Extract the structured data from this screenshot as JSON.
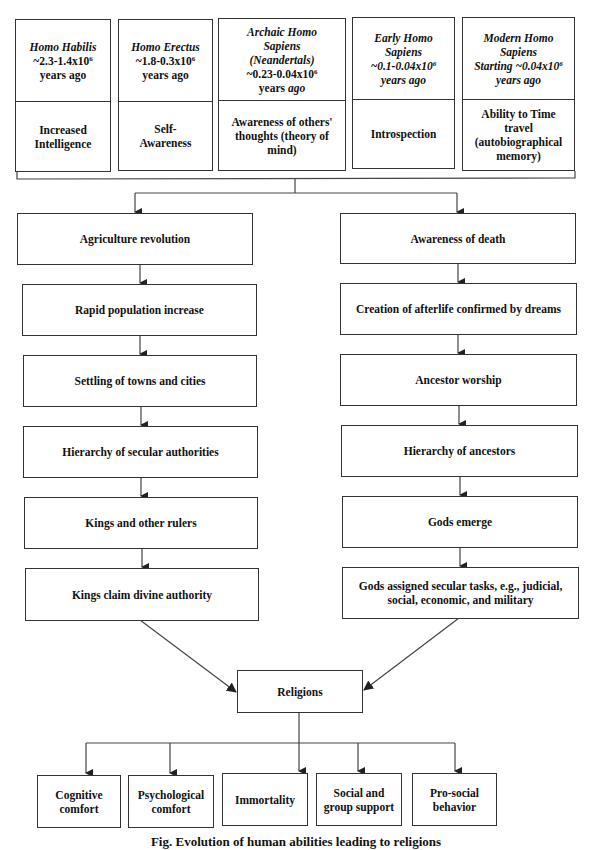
{
  "species": [
    {
      "name": "Homo Habilis",
      "range": "~2.3-1.4x10",
      "exp": "6",
      "suffix": "years ago",
      "trait": "Increased Intelligence"
    },
    {
      "name": "Homo Erectus",
      "range": "~1.8-0.3x10",
      "exp": "6",
      "suffix": "years ago",
      "trait": "Self-Awareness"
    },
    {
      "name_line1": "Archaic Homo",
      "name_line2": "Sapiens",
      "name_line3": "(Neandertals)",
      "range": "~0.23-0.04x10",
      "exp": "6",
      "suffix_plain": "years",
      "suffix_italic": "ago",
      "trait": "Awareness of others' thoughts (theory of mind)"
    },
    {
      "name_line1": "Early Homo",
      "name_line2": "Sapiens",
      "range": "~0.1-0.04x10",
      "exp": "6",
      "suffix": "years ago",
      "trait": "Introspection"
    },
    {
      "name_line1": "Modern Homo",
      "name_line2": "Sapiens",
      "range": "Starting ~0.04x10",
      "exp": "6",
      "suffix": "years ago",
      "trait": "Ability to Time travel (autobiographical memory)"
    }
  ],
  "left_chain": [
    "Agriculture revolution",
    "Rapid population increase",
    "Settling of towns and cities",
    "Hierarchy of secular authorities",
    "Kings and other rulers",
    "Kings claim divine authority"
  ],
  "right_chain": [
    "Awareness of death",
    "Creation of afterlife confirmed by dreams",
    "Ancestor worship",
    "Hierarchy of ancestors",
    "Gods emerge",
    "Gods assigned secular tasks, e.g., judicial, social, economic, and military"
  ],
  "center": "Religions",
  "outcomes": [
    "Cognitive comfort",
    "Psychological comfort",
    "Immortality",
    "Social and group support",
    "Pro-social behavior"
  ],
  "caption": "Fig. Evolution of human abilities leading to religions",
  "colors": {
    "line": "#333333",
    "text": "#111111",
    "background": "#ffffff"
  }
}
